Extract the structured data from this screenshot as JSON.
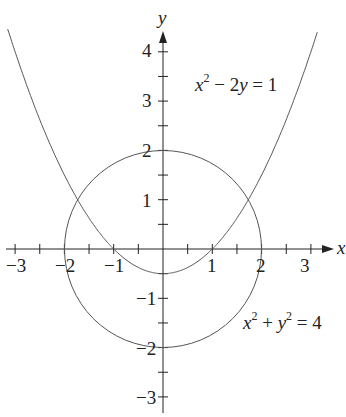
{
  "chart_data": {
    "type": "line",
    "title": "",
    "xlabel": "x",
    "ylabel": "y",
    "xlim": [
      -3.3,
      3.4
    ],
    "ylim": [
      -3.3,
      4.4
    ],
    "x_ticks": [
      -3,
      -2,
      -1,
      1,
      2,
      3
    ],
    "y_ticks": [
      4,
      3,
      2,
      1,
      -1,
      -2,
      -3
    ],
    "grid": false,
    "series": [
      {
        "name": "parabola",
        "equation": "x^2 - 2y = 1",
        "label": "x² − 2y = 1",
        "type": "curve",
        "y_of_x": "(x^2 - 1)/2",
        "x_range": [
          -3.2,
          3.2
        ]
      },
      {
        "name": "circle",
        "equation": "x^2 + y^2 = 4",
        "label": "x² + y² = 4",
        "type": "circle",
        "center": [
          0,
          0
        ],
        "radius": 2
      }
    ],
    "intersections": [
      [
        -1.73,
        1
      ],
      [
        1.73,
        1
      ]
    ]
  },
  "labels": {
    "x_axis": "x",
    "y_axis": "y",
    "parabola_eq": {
      "a": "x",
      "a_exp": "2",
      "rest": " − 2",
      "b": "y",
      "tail": " = 1"
    },
    "circle_eq": {
      "a": "x",
      "a_exp": "2",
      "mid": " + ",
      "b": "y",
      "b_exp": "2",
      "tail": " = 4"
    },
    "x_ticks": [
      "−3",
      "−2",
      "−1",
      "1",
      "2",
      "3"
    ],
    "y_ticks": [
      "4",
      "3",
      "2",
      "1",
      "−1",
      "−2",
      "−3"
    ]
  },
  "colors": {
    "axis": "#222222",
    "curve": "#555555"
  }
}
